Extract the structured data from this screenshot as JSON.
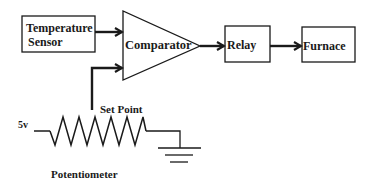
{
  "diagram": {
    "blocks": {
      "sensor": {
        "line1": "Temperature",
        "line2": "Sensor"
      },
      "comparator": {
        "label": "Comparator"
      },
      "relay": {
        "label": "Relay"
      },
      "furnace": {
        "label": "Furnace"
      }
    },
    "circuit": {
      "voltage_label": "5v",
      "setpoint_label": "Set Point",
      "potentiometer_label": "Potentiometer"
    },
    "colors": {
      "stroke": "#1a1a1a",
      "background": "#ffffff"
    }
  }
}
